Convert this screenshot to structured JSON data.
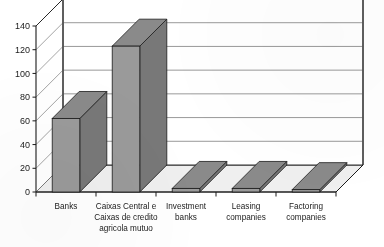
{
  "chart_data": {
    "type": "bar",
    "title": "",
    "subtitle": "",
    "xlabel": "",
    "ylabel": "",
    "categories": [
      "Banks",
      "Caixas Central e Caixas de credito agricola mutuo",
      "Investment banks",
      "Leasing companies",
      "Factoring companies"
    ],
    "category_lines": [
      [
        "Banks"
      ],
      [
        "Caixas Central e",
        "Caixas de credito",
        "agricola mutuo"
      ],
      [
        "Investment",
        "banks"
      ],
      [
        "Leasing",
        "companies"
      ],
      [
        "Factoring",
        "companies"
      ]
    ],
    "values": [
      62,
      123,
      3,
      3,
      2
    ],
    "ylim": [
      0,
      140
    ],
    "ytick_step": 20,
    "ytick_labels": [
      "0",
      "20",
      "40",
      "60",
      "80",
      "100",
      "120",
      "140"
    ],
    "ytick_values": [
      0,
      20,
      40,
      60,
      80,
      100,
      120,
      140
    ],
    "grid": true,
    "grid_axis": "y",
    "legend": false,
    "legend_position": "none",
    "projection": "3d",
    "series": [
      {
        "name": "Number of institutions",
        "values": [
          62,
          123,
          3,
          3,
          2
        ]
      }
    ]
  },
  "style": {
    "bar_front_color": "#9a9a9a",
    "bar_top_color": "#8a8a8a",
    "bar_side_color": "#787878",
    "bar_outline_color": "#1a1a1a",
    "grid_color": "#8d8d8d",
    "axis_color": "#1a1a1a",
    "wall_color": "#ffffff",
    "floor_color": "#efefef",
    "background_color": "#ffffff",
    "text_color": "#1b1b1b"
  }
}
